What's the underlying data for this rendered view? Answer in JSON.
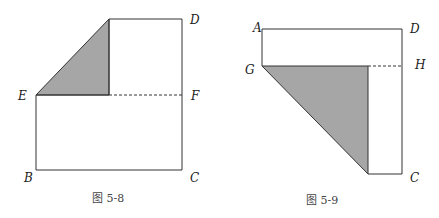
{
  "colors": {
    "line": "#333333",
    "shade": "#a6a6a6",
    "background": "#ffffff"
  },
  "figures": [
    {
      "caption": "图 5-8",
      "labels": {
        "D": "D",
        "E": "E",
        "F": "F",
        "B": "B",
        "C": "C"
      },
      "description": "Rectangle with a folded top-left corner forming a shaded triangle; dashed line EF"
    },
    {
      "caption": "图 5-9",
      "labels": {
        "A": "A",
        "D": "D",
        "G": "G",
        "H": "H",
        "C": "C"
      },
      "description": "Rectangle with a folded lower-left portion forming a shaded triangle; dashed line GH"
    }
  ]
}
